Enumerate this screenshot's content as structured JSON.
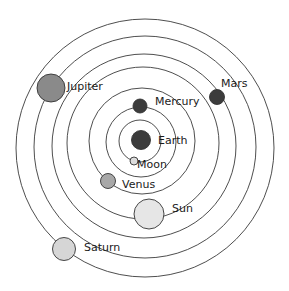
{
  "diagram": {
    "orbits": [
      {
        "name": "moon-orbit",
        "cx": 140,
        "cy": 141,
        "r": 21
      },
      {
        "name": "mercury-orbit",
        "cx": 141,
        "cy": 142,
        "r": 35
      },
      {
        "name": "venus-orbit",
        "cx": 142,
        "cy": 141,
        "r": 53
      },
      {
        "name": "sun-orbit",
        "cx": 143,
        "cy": 143,
        "r": 76
      },
      {
        "name": "mars-orbit",
        "cx": 144,
        "cy": 146,
        "r": 92
      },
      {
        "name": "jupiter-orbit",
        "cx": 145,
        "cy": 147,
        "r": 111
      },
      {
        "name": "saturn-orbit",
        "cx": 145,
        "cy": 148,
        "r": 129
      }
    ],
    "bodies": [
      {
        "name": "Earth",
        "cx": 141,
        "cy": 140,
        "r": 9.5,
        "fill": "#3c3c3c",
        "label": "Earth",
        "lx": 158,
        "ly": 135
      },
      {
        "name": "Moon",
        "cx": 134,
        "cy": 161,
        "r": 4,
        "fill": "#dcdcdc",
        "label": "Moon",
        "lx": 137,
        "ly": 159
      },
      {
        "name": "Mercury",
        "cx": 140,
        "cy": 106,
        "r": 7,
        "fill": "#3c3c3c",
        "label": "Mercury",
        "lx": 155,
        "ly": 96
      },
      {
        "name": "Venus",
        "cx": 108,
        "cy": 181,
        "r": 7.5,
        "fill": "#a8a8a8",
        "label": "Venus",
        "lx": 122,
        "ly": 179
      },
      {
        "name": "Sun",
        "cx": 149,
        "cy": 214,
        "r": 15,
        "fill": "#e6e6e6",
        "label": "Sun",
        "lx": 172,
        "ly": 203
      },
      {
        "name": "Mars",
        "cx": 217,
        "cy": 97,
        "r": 7.5,
        "fill": "#3c3c3c",
        "label": "Mars",
        "lx": 221,
        "ly": 78
      },
      {
        "name": "Jupiter",
        "cx": 51,
        "cy": 88,
        "r": 14,
        "fill": "#8a8a8a",
        "label": "Jupiter",
        "lx": 67,
        "ly": 81
      },
      {
        "name": "Saturn",
        "cx": 64,
        "cy": 249,
        "r": 11.5,
        "fill": "#d6d6d6",
        "label": "Saturn",
        "lx": 84,
        "ly": 242
      }
    ]
  }
}
